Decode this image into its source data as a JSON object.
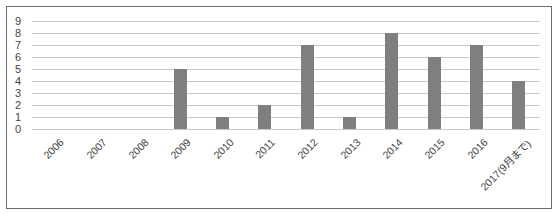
{
  "chart_data": {
    "type": "bar",
    "title": "",
    "xlabel": "",
    "ylabel": "",
    "categories": [
      "2006",
      "2007",
      "2008",
      "2009",
      "2010",
      "2011",
      "2012",
      "2013",
      "2014",
      "2015",
      "2016",
      "2017(9月まで)"
    ],
    "values": [
      0,
      0,
      0,
      5,
      1,
      2,
      7,
      1,
      8,
      6,
      7,
      4
    ],
    "ylim": [
      0,
      9
    ],
    "yticks": [
      "0",
      "1",
      "2",
      "3",
      "4",
      "5",
      "6",
      "7",
      "8",
      "9"
    ],
    "grid": true,
    "legend": null,
    "bar_color": "#7f7f7f",
    "grid_color": "#c8c8c8"
  }
}
